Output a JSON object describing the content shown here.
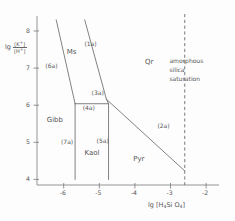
{
  "chart_data": {
    "type": "line",
    "title": "",
    "xlabel": "lg [H4SiO4]",
    "ylabel": "lg [K+]/[H+]",
    "xlim": [
      -6.75,
      -1.75
    ],
    "ylim": [
      3.85,
      8.35
    ],
    "xticks": [
      -6,
      -5,
      -4,
      -3,
      -2
    ],
    "xtick_labels": [
      "-6",
      "-5",
      "-4",
      "-3",
      "-2"
    ],
    "yticks": [
      4,
      5,
      6,
      7,
      8
    ],
    "ytick_labels": [
      "4",
      "5",
      "6",
      "7",
      "8"
    ],
    "grid": false,
    "legend": "none",
    "fields": [
      {
        "name": "Ms",
        "x": -5.72,
        "y": 7.42
      },
      {
        "name": "Gibb",
        "x": -6.28,
        "y": 5.57
      },
      {
        "name": "Kaol",
        "x": -5.22,
        "y": 4.68
      },
      {
        "name": "Pyr",
        "x": -3.85,
        "y": 4.52
      },
      {
        "name": "Qr",
        "x": -3.52,
        "y": 7.13
      }
    ],
    "boundaries": [
      {
        "id": "(1a)",
        "label_x": -5.22,
        "label_y": 7.66,
        "points": [
          [
            -5.41,
            8.3
          ],
          [
            -4.8,
            6.16
          ]
        ]
      },
      {
        "id": "(2a)",
        "label_x": -3.17,
        "label_y": 5.43,
        "points": [
          [
            -4.8,
            6.16
          ],
          [
            -2.6,
            4.23
          ]
        ]
      },
      {
        "id": "(3a)",
        "label_x": -5.02,
        "label_y": 6.32,
        "points": [
          [
            -4.8,
            6.16
          ],
          [
            -4.74,
            6.04
          ]
        ]
      },
      {
        "id": "(4a)",
        "label_x": -5.27,
        "label_y": 5.93,
        "points": [
          [
            -5.68,
            6.04
          ],
          [
            -4.74,
            6.04
          ]
        ]
      },
      {
        "id": "(5a)",
        "label_x": -4.88,
        "label_y": 5.03,
        "points": [
          [
            -4.74,
            6.04
          ],
          [
            -4.74,
            4.0
          ]
        ]
      },
      {
        "id": "(6a)",
        "label_x": -6.32,
        "label_y": 7.05,
        "points": [
          [
            -6.21,
            8.3
          ],
          [
            -5.68,
            6.04
          ]
        ]
      },
      {
        "id": "(7a)",
        "label_x": -5.88,
        "label_y": 5.02,
        "points": [
          [
            -5.68,
            6.04
          ],
          [
            -5.68,
            4.0
          ]
        ]
      }
    ],
    "reference_line": {
      "id": "amorphous-silica-saturation",
      "x": -2.6,
      "style": "dashed",
      "label_lines": [
        "amorphous",
        "silica",
        "saturation"
      ],
      "label_x": -3.03,
      "label_y": 7.3
    },
    "axis_label_fragments": {
      "y_prefix": "lg",
      "y_numerator": "[K",
      "y_numerator_sup": "+",
      "y_numerator_end": "]",
      "y_denominator": "[H",
      "y_denominator_sup": "+",
      "y_denominator_end": "]",
      "x_prefix": "lg",
      "x_open": "[H",
      "x_sub1": "4",
      "x_mid": "Si O",
      "x_sub2": "4",
      "x_close": "]"
    },
    "colors": {
      "line": "#6b6b6b",
      "axis": "#7a7a7a",
      "text": "#555555",
      "background": "#fdfdfd"
    }
  }
}
